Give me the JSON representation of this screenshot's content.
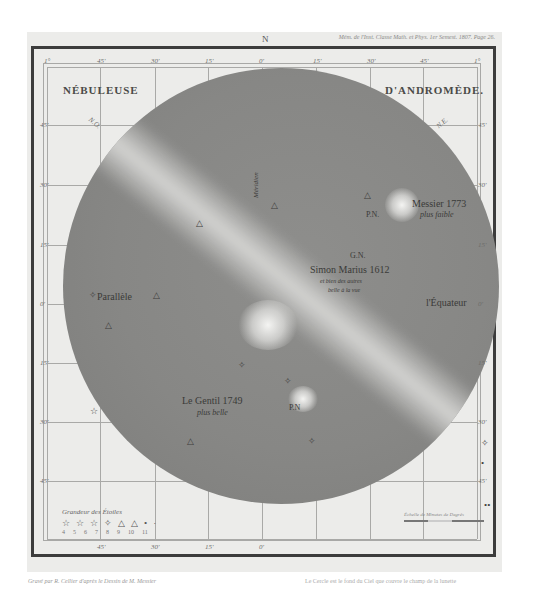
{
  "plate": {
    "header_note": "Mém. de l'Inst. Classe Math. et Phys. 1er Semest. 1807. Page 26.",
    "north_marker": "N",
    "title_left": "NÉBULEUSE",
    "title_right": "D'ANDROMÈDE."
  },
  "axes": {
    "top_ticks": [
      "1°",
      "45'",
      "30'",
      "15'",
      "0'",
      "15'",
      "30'",
      "45'",
      "1°"
    ],
    "left_ticks": [
      "45'",
      "30'",
      "15'",
      "0'",
      "15'",
      "30'",
      "45'"
    ],
    "right_ticks": [
      "45'",
      "30'",
      "15'",
      "0'",
      "15'",
      "30'",
      "45'"
    ],
    "bottom_ticks": [
      "45'",
      "30'",
      "15'",
      "0'"
    ],
    "corner_labels": {
      "no": "N.O.",
      "ne": "N.E."
    }
  },
  "labels": {
    "meridien": "Méridien",
    "parallele": "Parallèle",
    "equateur": "l'Équateur",
    "messier_title": "Messier 1773",
    "messier_sub": "plus faible",
    "pn_upper": "P.N.",
    "gn": "G.N.",
    "simon_marius": "Simon Marius 1612",
    "simon_sub1": "et bien des autres",
    "simon_sub2": "belle à la vue",
    "legentil_title": "Le Gentil 1749",
    "legentil_sub": "plus belle",
    "pn_lower": "P.N"
  },
  "stars": [
    {
      "id": "s1",
      "num": "11",
      "x": 198,
      "y": 213
    },
    {
      "id": "s2",
      "num": "14",
      "x": 273,
      "y": 196
    },
    {
      "id": "s3",
      "num": "12",
      "x": 366,
      "y": 186
    },
    {
      "id": "s4",
      "num": "8",
      "x": 92,
      "y": 286
    },
    {
      "id": "s5",
      "num": "9",
      "x": 155,
      "y": 286
    },
    {
      "id": "s6",
      "num": "10",
      "x": 108,
      "y": 317
    },
    {
      "id": "s7",
      "num": "13",
      "x": 241,
      "y": 358
    },
    {
      "id": "s8",
      "num": "15",
      "x": 287,
      "y": 373
    },
    {
      "id": "s9",
      "num": "9",
      "x": 219,
      "y": 384
    },
    {
      "id": "s10",
      "num": "6",
      "x": 92,
      "y": 404
    },
    {
      "id": "s11",
      "num": "10",
      "x": 189,
      "y": 434
    },
    {
      "id": "s12",
      "num": "8",
      "x": 311,
      "y": 434
    },
    {
      "id": "s13",
      "num": "8",
      "x": 484,
      "y": 435
    },
    {
      "id": "s14",
      "num": "20",
      "x": 483,
      "y": 456
    },
    {
      "id": "s15",
      "num": "21 22",
      "x": 488,
      "y": 498
    }
  ],
  "legend": {
    "title": "Grandeur des Étoiles",
    "symbols": [
      "☆",
      "☆",
      "☆",
      "✧",
      "△",
      "△",
      "•",
      "·"
    ],
    "magnitudes": [
      "4",
      "5",
      "6",
      "7",
      "8",
      "9",
      "10",
      "11"
    ]
  },
  "scale": {
    "title": "Échelle de Minutes de Degrés"
  },
  "footer": {
    "left": "Gravé par R. Cellier d'après le Dessin de M. Messier",
    "right": "Le Cercle est le fond du Ciel que couvre le champ de la lunette"
  }
}
